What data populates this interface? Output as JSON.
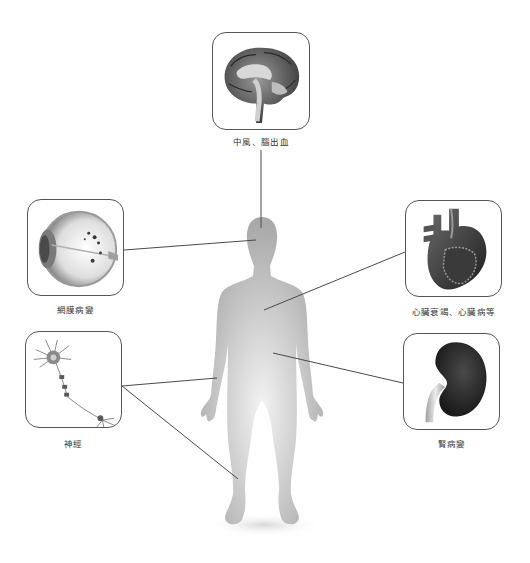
{
  "diagram": {
    "center_figure": "human-body-silhouette",
    "organs": [
      {
        "id": "brain",
        "icon": "brain-icon",
        "label": "中風、腦出血"
      },
      {
        "id": "eye",
        "icon": "eye-icon",
        "label": "網膜病變"
      },
      {
        "id": "heart",
        "icon": "heart-icon",
        "label": "心臟衰竭、心臟病等"
      },
      {
        "id": "kidney",
        "icon": "kidney-icon",
        "label": "腎病變"
      },
      {
        "id": "nerve",
        "icon": "neuron-icon",
        "label": "神經"
      }
    ],
    "colors": {
      "line": "#4a4a4a",
      "frame": "#555555",
      "silhouette": "#b8b8b8"
    }
  }
}
